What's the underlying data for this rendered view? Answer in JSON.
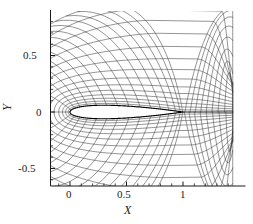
{
  "figure": {
    "kind": "mesh-plot",
    "background": "#ffffff",
    "ink": "#1a1a1a",
    "grid_color": "#3a3a3a",
    "body_color": "#000000"
  },
  "axes": {
    "x_title": "X",
    "y_title": "Y",
    "x_ticks": [
      {
        "label": "0",
        "value": 0
      },
      {
        "label": "0.5",
        "value": 0.5
      },
      {
        "label": "1",
        "value": 1
      }
    ],
    "y_ticks": [
      {
        "label": "0.5",
        "value": 0.5
      },
      {
        "label": "0",
        "value": 0
      },
      {
        "label": "-0.5",
        "value": -0.5
      }
    ],
    "x_range": [
      -0.232,
      1.434
    ],
    "y_range": [
      -0.64,
      0.89
    ],
    "x_minor_step": 0.1,
    "y_minor_step": 0.1
  },
  "chart_data": {
    "type": "line",
    "title": "",
    "subtitle": "",
    "xlabel": "X",
    "ylabel": "Y",
    "xlim": [
      -0.232,
      1.434
    ],
    "ylim": [
      -0.64,
      0.89
    ],
    "grid": false,
    "legend": "none",
    "body": {
      "name": "airfoil",
      "type": "NACA 0012 (symmetric)",
      "chord": 1.0,
      "thickness_ratio": 0.12,
      "leading_edge_x": 0.0,
      "trailing_edge_x": 1.0,
      "angle_of_attack_deg": 0
    },
    "mesh": {
      "family": "C-grid",
      "radial_lines": 48,
      "circumferential_lines": 14,
      "wake_cut": true,
      "outer_extent_x": 1.434,
      "outer_extent_y": 0.89
    },
    "series": [
      {
        "name": "airfoil-surface",
        "values": []
      },
      {
        "name": "grid-radial",
        "values": []
      },
      {
        "name": "grid-circumferential",
        "values": []
      }
    ]
  }
}
